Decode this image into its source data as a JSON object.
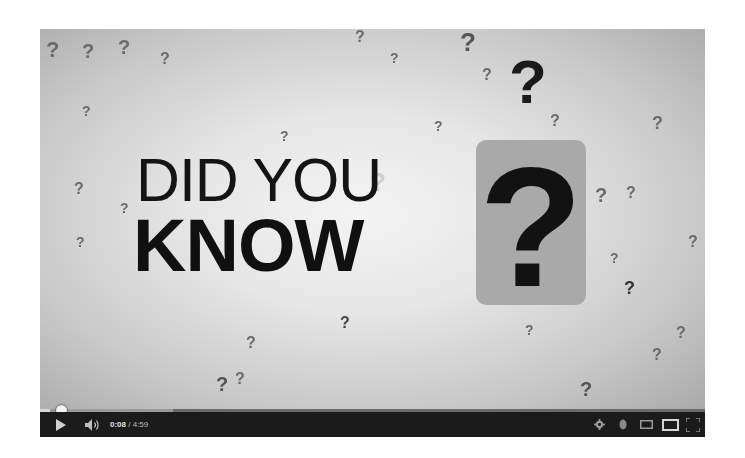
{
  "video": {
    "title_line1": "DID YOU",
    "title_line2": "KNOW",
    "box_glyph": "?",
    "accent_glyph": "?",
    "background_glyph": "?"
  },
  "player": {
    "current_time": "0:08",
    "separator": " / ",
    "duration": "4:59",
    "progress_percent": 1.5,
    "buffered_percent": 20,
    "controls": {
      "play": "play-icon",
      "volume": "volume-icon",
      "settings": "gear-icon",
      "annotations": "info-icon",
      "small_player": "small-player-icon",
      "theater": "theater-mode-icon",
      "fullscreen": "fullscreen-icon"
    }
  },
  "colors": {
    "control_bar": "#1b1b1b",
    "video_bg": "#e6e6e6",
    "text_dark": "#141414",
    "question_box": "#a9a9a9"
  }
}
